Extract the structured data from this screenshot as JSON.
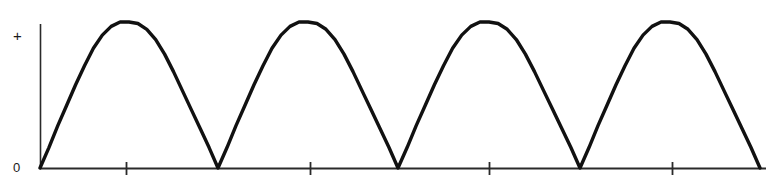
{
  "figure": {
    "title_fragment": "halfwave rectified sinusoid",
    "background_color": "#ffffff",
    "curve_color": "#111111",
    "axis_color": "#1a1a1a",
    "width": 773,
    "height": 188
  },
  "labels": {
    "y_top": "+",
    "y_zero": "0"
  },
  "chart_data": {
    "type": "line",
    "title": "",
    "subtitle": "",
    "xlabel": "",
    "ylabel": "",
    "grid": false,
    "legend": null,
    "x_tick_labels": [
      "",
      "",
      "",
      ""
    ],
    "y_tick_labels": [
      "0",
      "+"
    ],
    "ylim": [
      0,
      1
    ],
    "xlim": [
      0,
      4
    ],
    "period": 1,
    "num_cycles": 4,
    "amplitude": 1,
    "axis_pixels": {
      "origin_x": 40,
      "origin_y": 168,
      "y_axis_top": 24,
      "x_axis_right": 766,
      "peak_y": 22
    },
    "zero_crossings_px": [
      40,
      218,
      398,
      580,
      760
    ],
    "peaks_px": [
      126,
      310,
      489,
      672
    ],
    "tick_positions_px": [
      126,
      310,
      489,
      672
    ],
    "x": [
      0,
      0.05,
      0.1,
      0.15,
      0.2,
      0.25,
      0.3,
      0.35,
      0.4,
      0.45,
      0.5,
      0.55,
      0.6,
      0.65,
      0.7,
      0.75,
      0.8,
      0.85,
      0.9,
      0.95,
      1
    ],
    "values": [
      0,
      0.14,
      0.29,
      0.43,
      0.57,
      0.7,
      0.82,
      0.91,
      0.97,
      1,
      1,
      0.99,
      0.95,
      0.88,
      0.78,
      0.66,
      0.53,
      0.4,
      0.27,
      0.14,
      0
    ],
    "series": [
      {
        "name": "rectified waveform",
        "values": [
          0,
          0.14,
          0.29,
          0.43,
          0.57,
          0.7,
          0.82,
          0.91,
          0.97,
          1,
          1,
          0.99,
          0.95,
          0.88,
          0.78,
          0.66,
          0.53,
          0.4,
          0.27,
          0.14,
          0
        ]
      }
    ]
  }
}
